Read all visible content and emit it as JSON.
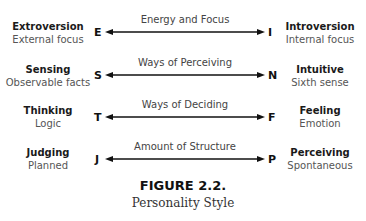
{
  "rows": [
    {
      "left": {
        "title": "Extroversion",
        "sub": "External focus",
        "letter": "E"
      },
      "axis": "Energy and Focus",
      "right": {
        "title": "Introversion",
        "sub": "Internal focus",
        "letter": "I"
      }
    },
    {
      "left": {
        "title": "Sensing",
        "sub": "Observable facts",
        "letter": "S"
      },
      "axis": "Ways of Perceiving",
      "right": {
        "title": "Intuitive",
        "sub": "Sixth sense",
        "letter": "N"
      }
    },
    {
      "left": {
        "title": "Thinking",
        "sub": "Logic",
        "letter": "T"
      },
      "axis": "Ways of Deciding",
      "right": {
        "title": "Feeling",
        "sub": "Emotion",
        "letter": "F"
      }
    },
    {
      "left": {
        "title": "Judging",
        "sub": "Planned",
        "letter": "J"
      },
      "axis": "Amount of Structure",
      "right": {
        "title": "Perceiving",
        "sub": "Spontaneous",
        "letter": "P"
      }
    }
  ],
  "caption": {
    "figure": "FIGURE 2.2.",
    "title": "Personality Style"
  }
}
